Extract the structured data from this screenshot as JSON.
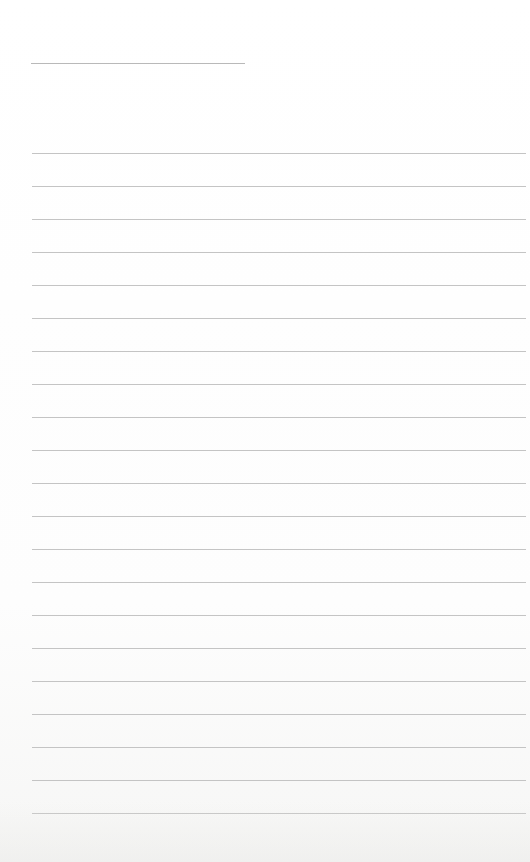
{
  "document": {
    "type": "lined-writing-paper",
    "header_line": {
      "x": 31,
      "y": 63,
      "width": 214
    },
    "lines": {
      "count": 21,
      "start_y": 153,
      "spacing": 33,
      "x": 32,
      "width": 494
    },
    "colors": {
      "paper": "#ffffff",
      "rule": "#c4c4c4",
      "header_rule": "#b9b9b9"
    }
  }
}
